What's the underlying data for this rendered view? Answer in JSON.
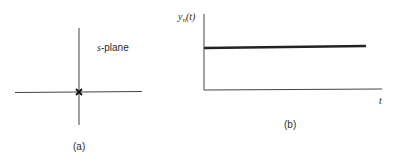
{
  "panel_a": {
    "label": "s-plane",
    "label_italic_part": "s",
    "label_rest": "-plane",
    "caption": "(a)",
    "marker": "x-mark-at-origin"
  },
  "panel_b": {
    "y_label_main": "y",
    "y_label_sub": "n",
    "y_label_arg": "(t)",
    "x_label": "t",
    "caption": "(b)",
    "curve": "constant-horizontal-line"
  },
  "colors": {
    "line": "#3a3a3a",
    "thick_line": "#222222",
    "text": "#2a2a2a"
  }
}
